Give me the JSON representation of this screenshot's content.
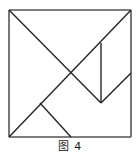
{
  "figure": {
    "caption": "图 4",
    "stroke_color": "#262626",
    "outline_color": "#555555",
    "background_color": "#ffffff",
    "stroke_width": 1.4,
    "outline_width": 1.6,
    "square": {
      "left": 9,
      "top": 10,
      "right": 131,
      "bottom": 137,
      "width": 122,
      "height": 127
    },
    "vertices": {
      "top_left": "9,10",
      "top_right": "131,10",
      "bottom_left": "9,137",
      "bottom_right": "131,137",
      "center_cross": "71,77",
      "vertical_top": "101,43",
      "vertical_bottom": "101,103",
      "left_notch": "40,103",
      "bottom_mid": "71,137",
      "right_mid": "131,73"
    },
    "segments": [
      {
        "name": "outline-top",
        "points": "9,10 131,10",
        "role": "square-border"
      },
      {
        "name": "outline-right",
        "points": "131,10 131,137",
        "role": "square-border"
      },
      {
        "name": "outline-bottom",
        "points": "131,137 9,137",
        "role": "square-border"
      },
      {
        "name": "outline-left",
        "points": "9,137 9,10",
        "role": "square-border"
      },
      {
        "name": "main-diagonal",
        "points": "9,10 101,103",
        "role": "cut"
      },
      {
        "name": "anti-diagonal",
        "points": "9,137 131,10",
        "role": "cut"
      },
      {
        "name": "vertical-cut",
        "points": "101,43 101,103",
        "role": "cut"
      },
      {
        "name": "lower-left-cut",
        "points": "40,103 71,137",
        "role": "cut"
      },
      {
        "name": "lower-right-cut",
        "points": "101,103 131,73",
        "role": "cut"
      }
    ]
  }
}
